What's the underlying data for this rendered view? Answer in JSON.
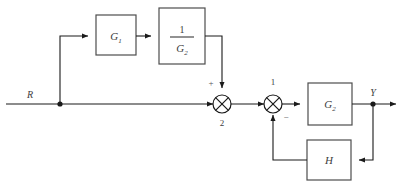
{
  "diagram": {
    "type": "block-diagram",
    "signals": {
      "input_label": "R",
      "output_label": "Y"
    },
    "blocks": [
      {
        "id": "g1",
        "name": "forward-compensator-block",
        "base": "G",
        "subscript": "1",
        "x": 96,
        "y": 15,
        "w": 40,
        "h": 40
      },
      {
        "id": "inv_g2",
        "name": "inverse-plant-block",
        "numerator": "1",
        "denominator_base": "G",
        "denominator_subscript": "2",
        "x": 159,
        "y": 8,
        "w": 46,
        "h": 56
      },
      {
        "id": "g2",
        "name": "plant-block",
        "base": "G",
        "subscript": "2",
        "x": 308,
        "y": 83,
        "w": 44,
        "h": 42
      },
      {
        "id": "h",
        "name": "feedback-block",
        "base": "H",
        "subscript": "",
        "x": 307,
        "y": 140,
        "w": 44,
        "h": 40
      }
    ],
    "summing_junctions": [
      {
        "id": "sum2",
        "name": "summing-junction-2",
        "index_label": "2",
        "index_position": "below",
        "cx": 222,
        "cy": 104,
        "r": 9,
        "signs": [
          {
            "value": "+",
            "input": "top",
            "x": 211,
            "y": 84
          }
        ]
      },
      {
        "id": "sum1",
        "name": "summing-junction-1",
        "index_label": "1",
        "index_position": "above",
        "cx": 273,
        "cy": 104,
        "r": 9,
        "signs": [
          {
            "value": "−",
            "input": "bottom",
            "x": 285,
            "y": 118
          }
        ]
      }
    ],
    "labels": {
      "sum2_index": "2",
      "sum1_index": "1",
      "sum2_plus": "+",
      "sum1_minus": "−"
    },
    "colors": {
      "wire": "#1a1a1a",
      "box_stroke": "#4d4d4d",
      "text": "#3d3d3d",
      "background": "#ffffff"
    }
  }
}
